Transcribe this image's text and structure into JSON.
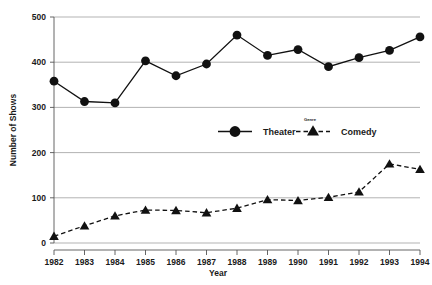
{
  "chart_data": {
    "type": "line",
    "title": "",
    "xlabel": "Year",
    "ylabel": "Number of Shows",
    "legend_title": "Genre",
    "legend_position": "center-middle",
    "grid": true,
    "categories": [
      "1982",
      "1983",
      "1984",
      "1985",
      "1986",
      "1987",
      "1988",
      "1989",
      "1990",
      "1991",
      "1992",
      "1993",
      "1994"
    ],
    "x": [
      1982,
      1983,
      1984,
      1985,
      1986,
      1987,
      1988,
      1989,
      1990,
      1991,
      1992,
      1993,
      1994
    ],
    "xlim": [
      1982,
      1994
    ],
    "ylim": [
      0,
      500
    ],
    "yticks": [
      0,
      100,
      200,
      300,
      400,
      500
    ],
    "ytick_labels": [
      "0",
      "100",
      "200",
      "300",
      "400",
      "500"
    ],
    "series": [
      {
        "name": "Theater",
        "marker": "circle",
        "linestyle": "solid",
        "color": "#111111",
        "values": [
          358,
          313,
          310,
          403,
          370,
          396,
          460,
          415,
          428,
          390,
          410,
          426,
          456
        ]
      },
      {
        "name": "Comedy",
        "marker": "triangle",
        "linestyle": "dashed",
        "color": "#111111",
        "values": [
          15,
          38,
          60,
          73,
          72,
          67,
          77,
          96,
          94,
          101,
          113,
          175,
          163
        ]
      }
    ]
  },
  "axes": {
    "y_title": "Number of Shows",
    "x_title": "Year"
  },
  "legend": {
    "title": "Genre",
    "entries": [
      {
        "label": "Theater",
        "marker": "circle",
        "linestyle": "solid"
      },
      {
        "label": "Comedy",
        "marker": "triangle",
        "linestyle": "dashed"
      }
    ]
  }
}
